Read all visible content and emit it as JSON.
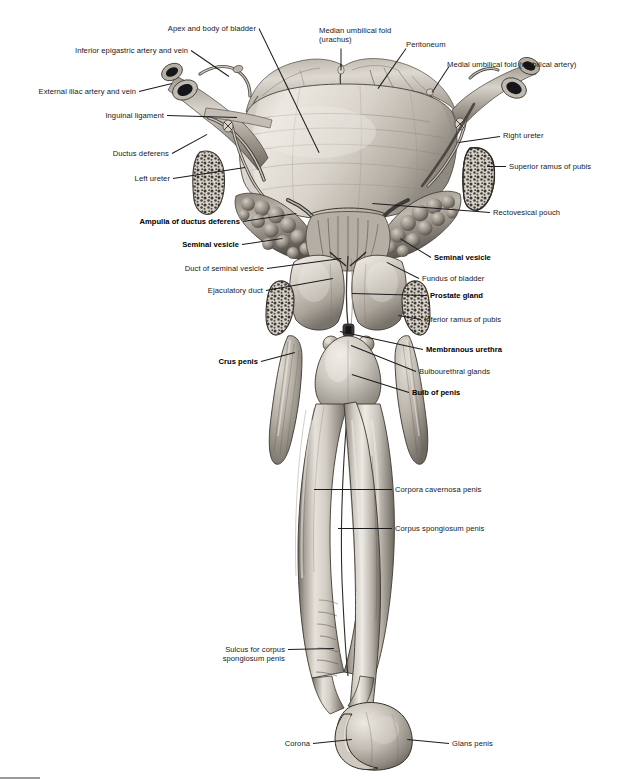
{
  "plate": {
    "title": "Male internal genital organs and urinary bladder, anterior view",
    "width": 629,
    "height": 779,
    "palette": {
      "ink": "#17171a",
      "leader": "#1b1b1e",
      "page": "#ffffff",
      "tissue_light": "#e3dfd8",
      "tissue_mid": "#b8b2a8",
      "tissue_dark": "#6f6a63",
      "bone_fill": "#cfcac1",
      "lumen_dark": "#15151a",
      "page_mark": "#9a9a9a"
    }
  },
  "labels": [
    {
      "id": "apex-body-bladder",
      "text": "Apex and body of bladder",
      "bold": false,
      "align": "right",
      "x": 256,
      "y": 24,
      "leader": {
        "x1": 259,
        "y1": 28,
        "x2": 319,
        "y2": 152
      }
    },
    {
      "id": "inferior-epigastric",
      "text": "Inferior epigastric artery and vein",
      "bold": false,
      "align": "right",
      "x": 188,
      "y": 46,
      "leader": {
        "x1": 191,
        "y1": 50,
        "x2": 229,
        "y2": 76
      }
    },
    {
      "id": "external-iliac",
      "text": "External iliac artery and vein",
      "bold": false,
      "align": "right",
      "x": 136,
      "y": 87,
      "leader": {
        "x1": 139,
        "y1": 91,
        "x2": 172,
        "y2": 83
      }
    },
    {
      "id": "inguinal-ligament",
      "text": "Inguinal ligament",
      "bold": false,
      "align": "right",
      "x": 164,
      "y": 111,
      "leader": {
        "x1": 167,
        "y1": 115,
        "x2": 237,
        "y2": 117
      }
    },
    {
      "id": "ductus-deferens",
      "text": "Ductus deferens",
      "bold": false,
      "align": "right",
      "x": 169,
      "y": 149,
      "leader": {
        "x1": 172,
        "y1": 153,
        "x2": 207,
        "y2": 134
      }
    },
    {
      "id": "left-ureter",
      "text": "Left ureter",
      "bold": false,
      "align": "right",
      "x": 170,
      "y": 174,
      "leader": {
        "x1": 173,
        "y1": 178,
        "x2": 245,
        "y2": 167
      }
    },
    {
      "id": "median-umbilical",
      "text": "Median umbilical fold\n(urachus)",
      "bold": false,
      "align": "left",
      "x": 319,
      "y": 26,
      "leader": {
        "x1": 341,
        "y1": 48,
        "x2": 341,
        "y2": 70
      }
    },
    {
      "id": "peritoneum",
      "text": "Peritoneum",
      "bold": false,
      "align": "left",
      "x": 406,
      "y": 40,
      "leader": {
        "x1": 406,
        "y1": 48,
        "x2": 378,
        "y2": 88
      }
    },
    {
      "id": "medial-umbilical",
      "text": "Medial umbilical fold (umbilical artery)",
      "bold": false,
      "align": "left",
      "x": 447,
      "y": 60,
      "leader": {
        "x1": 449,
        "y1": 66,
        "x2": 432,
        "y2": 92
      }
    },
    {
      "id": "right-ureter",
      "text": "Right ureter",
      "bold": false,
      "align": "left",
      "x": 503,
      "y": 131,
      "leader": {
        "x1": 500,
        "y1": 136,
        "x2": 458,
        "y2": 142
      }
    },
    {
      "id": "superior-ramus",
      "text": "Superior ramus of pubis",
      "bold": false,
      "align": "left",
      "x": 509,
      "y": 162,
      "leader": {
        "x1": 506,
        "y1": 166,
        "x2": 487,
        "y2": 166
      }
    },
    {
      "id": "rectovesical-pouch",
      "text": "Rectovesical pouch",
      "bold": false,
      "align": "left",
      "x": 493,
      "y": 208,
      "leader": {
        "x1": 490,
        "y1": 212,
        "x2": 372,
        "y2": 203
      }
    },
    {
      "id": "ampulla-ductus",
      "text": "Ampulla of ductus deferens",
      "bold": true,
      "align": "right",
      "x": 240,
      "y": 217,
      "leader": {
        "x1": 243,
        "y1": 221,
        "x2": 296,
        "y2": 213
      }
    },
    {
      "id": "seminal-vesicle-l",
      "text": "Seminal vesicle",
      "bold": true,
      "align": "right",
      "x": 239,
      "y": 240,
      "leader": {
        "x1": 242,
        "y1": 244,
        "x2": 283,
        "y2": 238
      }
    },
    {
      "id": "duct-seminal-vesicle",
      "text": "Duct of seminal vesicle",
      "bold": false,
      "align": "right",
      "x": 264,
      "y": 264,
      "leader": {
        "x1": 267,
        "y1": 268,
        "x2": 341,
        "y2": 258
      }
    },
    {
      "id": "ejaculatory-duct",
      "text": "Ejaculatory duct",
      "bold": false,
      "align": "right",
      "x": 263,
      "y": 286,
      "leader": {
        "x1": 266,
        "y1": 290,
        "x2": 333,
        "y2": 278
      }
    },
    {
      "id": "crus-penis",
      "text": "Crus penis",
      "bold": true,
      "align": "right",
      "x": 258,
      "y": 357,
      "leader": {
        "x1": 261,
        "y1": 361,
        "x2": 295,
        "y2": 352
      }
    },
    {
      "id": "seminal-vesicle-r",
      "text": "Seminal vesicle",
      "bold": true,
      "align": "left",
      "x": 434,
      "y": 253,
      "leader": {
        "x1": 431,
        "y1": 257,
        "x2": 400,
        "y2": 238
      }
    },
    {
      "id": "fundus-bladder",
      "text": "Fundus of bladder",
      "bold": false,
      "align": "left",
      "x": 422,
      "y": 274,
      "leader": {
        "x1": 419,
        "y1": 278,
        "x2": 387,
        "y2": 262
      }
    },
    {
      "id": "prostate-gland",
      "text": "Prostate gland",
      "bold": true,
      "align": "left",
      "x": 430,
      "y": 291,
      "leader": {
        "x1": 427,
        "y1": 295,
        "x2": 352,
        "y2": 293
      }
    },
    {
      "id": "inferior-ramus",
      "text": "Inferior ramus of pubis",
      "bold": false,
      "align": "left",
      "x": 424,
      "y": 315,
      "leader": {
        "x1": 421,
        "y1": 319,
        "x2": 398,
        "y2": 315
      }
    },
    {
      "id": "membranous-urethra",
      "text": "Membranous urethra",
      "bold": true,
      "align": "left",
      "x": 426,
      "y": 345,
      "leader": {
        "x1": 423,
        "y1": 349,
        "x2": 340,
        "y2": 331
      }
    },
    {
      "id": "bulbourethral",
      "text": "Bulbourethral glands",
      "bold": false,
      "align": "left",
      "x": 419,
      "y": 367,
      "leader": {
        "x1": 416,
        "y1": 371,
        "x2": 351,
        "y2": 345
      }
    },
    {
      "id": "bulb-penis",
      "text": "Bulb of penis",
      "bold": true,
      "align": "left",
      "x": 412,
      "y": 388,
      "leader": {
        "x1": 409,
        "y1": 392,
        "x2": 352,
        "y2": 374
      }
    },
    {
      "id": "corpora-cavernosa",
      "text": "Corpora cavernosa penis",
      "bold": false,
      "align": "left",
      "x": 395,
      "y": 485,
      "leader": {
        "x1": 392,
        "y1": 489,
        "x2": 314,
        "y2": 489
      }
    },
    {
      "id": "corpus-spongiosum",
      "text": "Corpus spongiosum penis",
      "bold": false,
      "align": "left",
      "x": 395,
      "y": 524,
      "leader": {
        "x1": 392,
        "y1": 528,
        "x2": 338,
        "y2": 528
      }
    },
    {
      "id": "sulcus-corpus",
      "text": "Sulcus for corpus\nspongiosum penis",
      "bold": false,
      "align": "right",
      "x": 285,
      "y": 645,
      "leader": {
        "x1": 288,
        "y1": 649,
        "x2": 334,
        "y2": 648
      }
    },
    {
      "id": "corona",
      "text": "Corona",
      "bold": false,
      "align": "right",
      "x": 310,
      "y": 739,
      "leader": {
        "x1": 313,
        "y1": 743,
        "x2": 352,
        "y2": 739
      }
    },
    {
      "id": "glans-penis",
      "text": "Glans penis",
      "bold": false,
      "align": "left",
      "x": 452,
      "y": 739,
      "leader": {
        "x1": 449,
        "y1": 743,
        "x2": 407,
        "y2": 739
      }
    }
  ],
  "figure_parts": [
    {
      "id": "urinary-bladder",
      "name": "urinary-bladder"
    },
    {
      "id": "peritoneum-sheet",
      "name": "peritoneum-sheet"
    },
    {
      "id": "median-umbilical-fold",
      "name": "median-umbilical-fold"
    },
    {
      "id": "medial-umbilical-fold",
      "name": "medial-umbilical-fold"
    },
    {
      "id": "left-vessel-bundle",
      "name": "external-iliac-vessels-left"
    },
    {
      "id": "right-vessel-bundle",
      "name": "external-iliac-vessels-right"
    },
    {
      "id": "left-ductus-deferens",
      "name": "ductus-deferens-left"
    },
    {
      "id": "right-ductus-deferens",
      "name": "ductus-deferens-right"
    },
    {
      "id": "left-ureter-tube",
      "name": "ureter-left"
    },
    {
      "id": "right-ureter-tube",
      "name": "ureter-right"
    },
    {
      "id": "seminal-vesicle-left",
      "name": "seminal-vesicle-left"
    },
    {
      "id": "seminal-vesicle-right",
      "name": "seminal-vesicle-right"
    },
    {
      "id": "prostate",
      "name": "prostate-gland"
    },
    {
      "id": "pubis-left",
      "name": "inferior-ramus-of-pubis-left"
    },
    {
      "id": "pubis-right",
      "name": "inferior-ramus-of-pubis-right"
    },
    {
      "id": "superior-ramus-left",
      "name": "superior-ramus-of-pubis-left"
    },
    {
      "id": "superior-ramus-right",
      "name": "superior-ramus-of-pubis-right"
    },
    {
      "id": "crus-left",
      "name": "crus-penis-left"
    },
    {
      "id": "crus-right",
      "name": "crus-penis-right"
    },
    {
      "id": "bulb",
      "name": "bulb-of-penis"
    },
    {
      "id": "corpus-cavernosum-l",
      "name": "corpus-cavernosum-left"
    },
    {
      "id": "corpus-cavernosum-r",
      "name": "corpus-cavernosum-right"
    },
    {
      "id": "corpus-spongiosum-shaft",
      "name": "corpus-spongiosum-shaft"
    },
    {
      "id": "glans",
      "name": "glans-penis"
    },
    {
      "id": "corona-ridge",
      "name": "corona-ridge"
    }
  ]
}
